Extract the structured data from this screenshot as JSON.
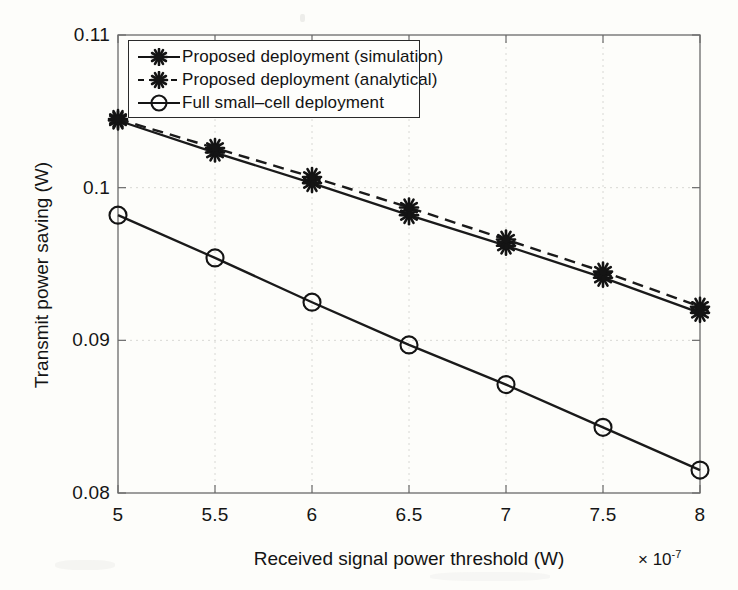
{
  "chart_data": {
    "type": "line",
    "title": "",
    "xlabel": "Received signal power threshold (W)",
    "ylabel": "Transmit power saving (W)",
    "x_multiplier": "× 10",
    "x_multiplier_exponent": "-7",
    "x": [
      5,
      5.5,
      6,
      6.5,
      7,
      7.5,
      8
    ],
    "xlim": [
      5,
      8
    ],
    "ylim": [
      0.08,
      0.11
    ],
    "xticks": [
      "5",
      "5.5",
      "6",
      "6.5",
      "7",
      "7.5",
      "8"
    ],
    "yticks": [
      "0.08",
      "0.09",
      "0.1",
      "0.11"
    ],
    "ytick_values": [
      0.08,
      0.09,
      0.1,
      0.11
    ],
    "grid": true,
    "legend_position": "upper-left-inside",
    "series": [
      {
        "name": "Proposed deployment (simulation)",
        "marker": "star",
        "linestyle": "solid",
        "color": "#1a1a1a",
        "values": [
          0.1044,
          0.1023,
          0.1003,
          0.0982,
          0.0962,
          0.0941,
          0.0918
        ]
      },
      {
        "name": "Proposed deployment (analytical)",
        "marker": "star",
        "linestyle": "dashed",
        "color": "#1a1a1a",
        "values": [
          0.1045,
          0.1026,
          0.1007,
          0.0987,
          0.0966,
          0.0945,
          0.0922
        ]
      },
      {
        "name": "Full small-cell deployment",
        "marker": "circle",
        "linestyle": "solid",
        "color": "#1a1a1a",
        "values": [
          0.0982,
          0.0954,
          0.0925,
          0.0897,
          0.0871,
          0.0843,
          0.0815
        ]
      }
    ]
  },
  "legend": {
    "items": [
      {
        "label": "Proposed deployment (simulation)",
        "marker": "star-marker-icon",
        "style": "solid"
      },
      {
        "label": "Proposed deployment (analytical)",
        "marker": "star-marker-icon",
        "style": "dashed"
      },
      {
        "label": "Full small–cell deployment",
        "marker": "circle-marker-icon",
        "style": "solid"
      }
    ]
  },
  "axes": {
    "y_label": "Transmit power saving (W)",
    "x_label": "Received signal power threshold (W)",
    "y_ticks": [
      "0.11",
      "0.1",
      "0.09",
      "0.08"
    ],
    "x_ticks": [
      "5",
      "5.5",
      "6",
      "6.5",
      "7",
      "7.5",
      "8"
    ],
    "x_exponent_prefix": "× 10",
    "x_exponent": "-7"
  },
  "colors": {
    "line": "#1a1a1a",
    "axis": "#555555",
    "grid": "#d8d8d4",
    "background": "#fdfdfa"
  }
}
